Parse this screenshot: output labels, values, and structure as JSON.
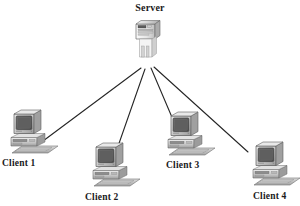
{
  "diagram": {
    "background_color": "#ffffff",
    "line_color": "#262626",
    "label_color": "#1a1a1a"
  },
  "server": {
    "label": "Server",
    "icon": "server-tower-icon",
    "x": 147,
    "y": 48
  },
  "clients": [
    {
      "label": "Client 1",
      "icon": "desktop-computer-icon",
      "x": 28,
      "y": 133
    },
    {
      "label": "Client 2",
      "icon": "desktop-computer-icon",
      "x": 110,
      "y": 166
    },
    {
      "label": "Client 3",
      "icon": "desktop-computer-icon",
      "x": 185,
      "y": 135
    },
    {
      "label": "Client 4",
      "icon": "desktop-computer-icon",
      "x": 270,
      "y": 165
    }
  ],
  "connections": [
    {
      "from": "Server",
      "to": "Client 1"
    },
    {
      "from": "Server",
      "to": "Client 2"
    },
    {
      "from": "Server",
      "to": "Client 3"
    },
    {
      "from": "Server",
      "to": "Client 4"
    }
  ]
}
